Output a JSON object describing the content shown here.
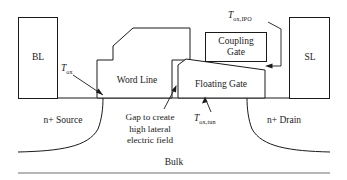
{
  "diagram": {
    "ink_color": "#1a1a1a",
    "rule_color": "#6e6e6e",
    "background": "#ffffff"
  },
  "contacts": {
    "bitline_label": "BL",
    "sourceline_label": "SL"
  },
  "gates": {
    "word_line_label": "Word Line",
    "floating_gate_label": "Floating Gate",
    "coupling_gate_line1": "Coupling",
    "coupling_gate_line2": "Gate"
  },
  "regions": {
    "source_label": "n+ Source",
    "drain_label": "n+ Drain",
    "bulk_label": "Bulk"
  },
  "annotations": {
    "tox": {
      "symbol": "T",
      "subscript": "ox"
    },
    "tox_ipo": {
      "symbol": "T",
      "subscript": "ox,IPO"
    },
    "tox_tun": {
      "symbol": "T",
      "subscript": "ox,tun"
    },
    "gap_note_line1": "Gap to create",
    "gap_note_line2": "high lateral",
    "gap_note_line3": "electric field"
  }
}
